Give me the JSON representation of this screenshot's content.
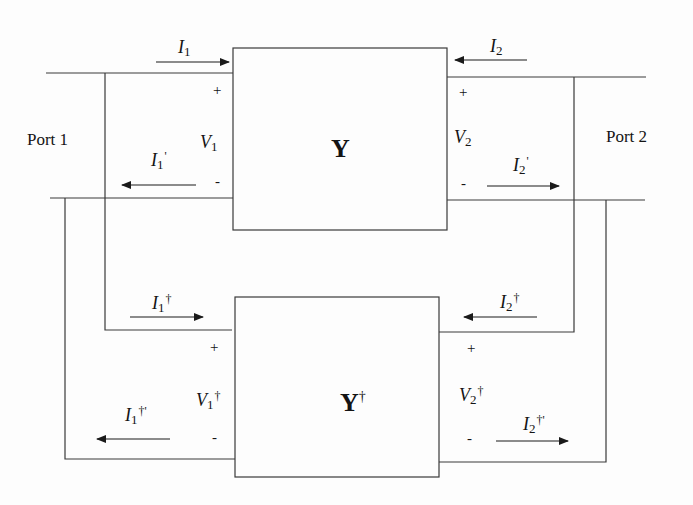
{
  "diagram": {
    "type": "two-port network interconnection",
    "blocks": {
      "top": {
        "label": "Y",
        "sup": ""
      },
      "bottom": {
        "label": "Y",
        "sup": "†"
      }
    },
    "ports": {
      "left": "Port 1",
      "right": "Port 2"
    },
    "top_network": {
      "I1": {
        "base": "I",
        "sub": "1",
        "sup": ""
      },
      "I2": {
        "base": "I",
        "sub": "2",
        "sup": ""
      },
      "I1p": {
        "base": "I",
        "sub": "1",
        "sup": "'"
      },
      "I2p": {
        "base": "I",
        "sub": "2",
        "sup": "'"
      },
      "V1": {
        "base": "V",
        "sub": "1",
        "sup": ""
      },
      "V2": {
        "base": "V",
        "sub": "2",
        "sup": ""
      }
    },
    "bottom_network": {
      "I1": {
        "base": "I",
        "sub": "1",
        "sup": "†"
      },
      "I2": {
        "base": "I",
        "sub": "2",
        "sup": "†"
      },
      "I1p": {
        "base": "I",
        "sub": "1",
        "sup": "†'"
      },
      "I2p": {
        "base": "I",
        "sub": "2",
        "sup": "†'"
      },
      "V1": {
        "base": "V",
        "sub": "1",
        "sup": "†"
      },
      "V2": {
        "base": "V",
        "sub": "2",
        "sup": "†"
      }
    },
    "signs": {
      "plus": "+",
      "minus": "-"
    },
    "colors": {
      "line": "#333333",
      "background": "#fdfdfd",
      "text": "#141414"
    }
  }
}
